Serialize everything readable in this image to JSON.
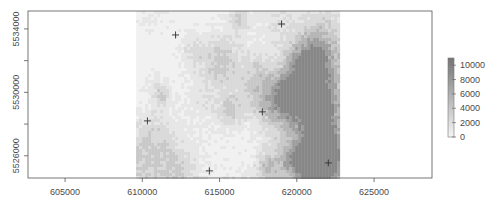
{
  "chart_data": {
    "type": "heatmap",
    "title": "",
    "xlabel": "",
    "ylabel": "",
    "xlim": [
      602600,
      628750
    ],
    "ylim": [
      5524600,
      5535130
    ],
    "grid": false,
    "x_ticks": [
      605000,
      610000,
      615000,
      620000,
      625000
    ],
    "x_tick_labels": [
      "605000",
      "610000",
      "615000",
      "620000",
      "625000"
    ],
    "y_ticks": [
      5526000,
      5528000,
      5530000,
      5532000,
      5534000
    ],
    "y_tick_labels": [
      "5526000",
      "",
      "5530000",
      "",
      "5534000"
    ],
    "raster": {
      "extent": {
        "xmin": 609600,
        "xmax": 622800,
        "ymin": 5524600,
        "ymax": 5535130
      },
      "value_range": [
        0,
        11000
      ],
      "palette": [
        "#f2f2f2",
        "#e6e6e6",
        "#d9d9d9",
        "#c8c8c8",
        "#b5b5b5",
        "#9e9e9e",
        "#878787"
      ],
      "description": "Greyscale raster; mostly light values with darker patches toward the east and south"
    },
    "points": {
      "symbol": "plus",
      "color": "#333333",
      "coords": [
        {
          "x": 612150,
          "y": 5533620
        },
        {
          "x": 619010,
          "y": 5534310
        },
        {
          "x": 610330,
          "y": 5528200
        },
        {
          "x": 617770,
          "y": 5528770
        },
        {
          "x": 614340,
          "y": 5525050
        },
        {
          "x": 622040,
          "y": 5525550
        }
      ]
    },
    "legend": {
      "placement": "right",
      "type": "colorbar",
      "ticks": [
        0,
        2000,
        4000,
        6000,
        8000,
        10000
      ],
      "tick_labels": [
        "0",
        "2000",
        "4000",
        "6000",
        "8000",
        "10000"
      ],
      "range": [
        0,
        11000
      ],
      "colors": [
        "#f5f5f5",
        "#dcdcdc",
        "#c2c2c2",
        "#a8a8a8",
        "#8e8e8e",
        "#747474"
      ]
    }
  }
}
